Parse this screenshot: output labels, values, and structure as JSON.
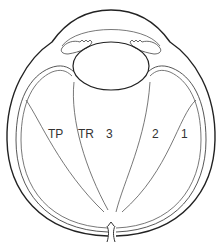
{
  "diagram": {
    "labels": [
      {
        "id": "tp",
        "text": "TP",
        "x": 48,
        "y": 128
      },
      {
        "id": "tr",
        "text": "TR",
        "x": 78,
        "y": 128
      },
      {
        "id": "zone3",
        "text": "3",
        "x": 106,
        "y": 128
      },
      {
        "id": "zone2",
        "text": "2",
        "x": 152,
        "y": 128
      },
      {
        "id": "zone1",
        "text": "1",
        "x": 181,
        "y": 128
      }
    ],
    "colors": {
      "outer_wall": "#222222",
      "inner_lines": "#555555",
      "background": "#ffffff"
    }
  }
}
